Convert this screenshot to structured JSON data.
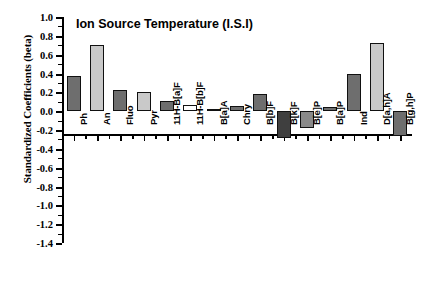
{
  "chart_data": {
    "type": "bar",
    "title": "Ion Source Temperature (I.S.I)",
    "xlabel": "",
    "ylabel": "Standardized Coefficients (beta)",
    "ylim": [
      -1.4,
      1.0
    ],
    "ytick_step": 0.2,
    "yticks": [
      "1.0",
      "0.8",
      "0.6",
      "0.4",
      "0.2",
      "0.0",
      "-0.2",
      "-0.4",
      "-0.6",
      "-0.8",
      "-1.0",
      "-1.2",
      "-1.4"
    ],
    "ytick_values": [
      1.0,
      0.8,
      0.6,
      0.4,
      0.2,
      0.0,
      -0.2,
      -0.4,
      -0.6,
      -0.8,
      -1.0,
      -1.2,
      -1.4
    ],
    "grid": false,
    "legend": "none",
    "categories": [
      "Ph",
      "An",
      "Fluo",
      "Pyr",
      "11H-B[a]F",
      "11H-B[b]F",
      "B[a]A",
      "Chry",
      "B[b]F",
      "B[k]F",
      "B[e]P",
      "B[a]P",
      "Ind",
      "D[a,h]A",
      "B[g,h]P"
    ],
    "values": [
      0.37,
      0.7,
      0.23,
      0.2,
      0.11,
      0.07,
      0.02,
      0.05,
      0.18,
      -0.28,
      -0.18,
      0.04,
      0.39,
      0.72,
      -0.26
    ],
    "bar_colors": [
      "#6e6e6e",
      "#c9c9c9",
      "#6e6e6e",
      "#c9c9c9",
      "#6e6e6e",
      "#ffffff",
      "#6e6e6e",
      "#6e6e6e",
      "#6e6e6e",
      "#3f3f3f",
      "#8a8a8a",
      "#6e6e6e",
      "#6e6e6e",
      "#c9c9c9",
      "#6e6e6e"
    ]
  },
  "colors": {
    "axis": "#000000",
    "background": "#ffffff",
    "bar_dark": "#6e6e6e",
    "bar_light": "#c9c9c9",
    "bar_white": "#ffffff"
  }
}
